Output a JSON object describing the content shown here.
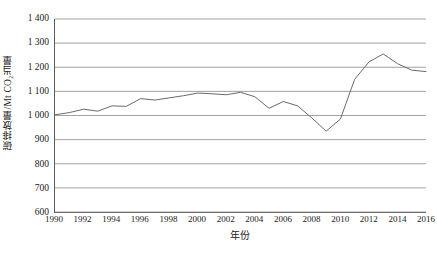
{
  "chart_data": {
    "type": "line",
    "title": "",
    "xlabel": "年份",
    "ylabel": "碳排放量/Mt CO₂当量",
    "x": [
      1990,
      1991,
      1992,
      1993,
      1994,
      1995,
      1996,
      1997,
      1998,
      1999,
      2000,
      2001,
      2002,
      2003,
      2004,
      2005,
      2006,
      2007,
      2008,
      2009,
      2010,
      2011,
      2012,
      2013,
      2014,
      2015,
      2016
    ],
    "values": [
      1003,
      1012,
      1026,
      1018,
      1040,
      1038,
      1070,
      1064,
      1073,
      1082,
      1093,
      1090,
      1086,
      1096,
      1078,
      1030,
      1058,
      1040,
      990,
      935,
      985,
      1150,
      1222,
      1255,
      1215,
      1188,
      1182
    ],
    "series": [
      {
        "name": "碳排放量",
        "values": [
          1003,
          1012,
          1026,
          1018,
          1040,
          1038,
          1070,
          1064,
          1073,
          1082,
          1093,
          1090,
          1086,
          1096,
          1078,
          1030,
          1058,
          1040,
          990,
          935,
          985,
          1150,
          1222,
          1255,
          1215,
          1188,
          1182
        ],
        "color": "#6b6b6b"
      }
    ],
    "xlim": [
      1990,
      2016
    ],
    "ylim": [
      600,
      1400
    ],
    "ytick_values": [
      600,
      700,
      800,
      900,
      1000,
      1100,
      1200,
      1300,
      1400
    ],
    "ytick_labels": [
      "600",
      "700",
      "800",
      "900",
      "1 000",
      "1 100",
      "1 200",
      "1 300",
      "1 400"
    ],
    "xtick_values": [
      1990,
      1992,
      1994,
      1996,
      1998,
      2000,
      2002,
      2004,
      2006,
      2008,
      2010,
      2012,
      2014,
      2016
    ],
    "xtick_labels": [
      "1990",
      "1992",
      "1994",
      "1996",
      "1998",
      "2000",
      "2002",
      "2004",
      "2006",
      "2008",
      "2010",
      "2012",
      "2014",
      "2016"
    ],
    "grid": true,
    "grid_axis": "y",
    "grid_color": "#8a8a8a",
    "axis_color": "#5c5c5c",
    "legend": false,
    "legend_position": "none",
    "annotations": []
  }
}
